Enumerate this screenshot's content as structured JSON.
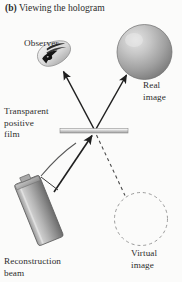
{
  "figure": {
    "caption_label": "(b)",
    "caption_text": "Viewing the hologram",
    "background_color": "#fbfbfa",
    "ink_color": "#2d2d2d"
  },
  "labels": {
    "observer": "Observer",
    "real_image_line1": "Real",
    "real_image_line2": "image",
    "film_line1": "Transparent",
    "film_line2": "positive",
    "film_line3": "film",
    "reconstruction_line1": "Reconstruction",
    "reconstruction_line2": "beam",
    "virtual_image_line1": "Virtual",
    "virtual_image_line2": "image"
  },
  "elements": {
    "sphere": {
      "name": "real-image-sphere",
      "cx": 144.5,
      "cy": 52,
      "r": 27.5,
      "fill_light": "#d9d9d9",
      "fill_dark": "#7d7d7d",
      "stroke": "#6e6e6e"
    },
    "virtual_circle": {
      "name": "virtual-image-circle",
      "cx": 141,
      "cy": 219,
      "r": 26.5,
      "stroke": "#8a8a8a",
      "dash": "3 3"
    },
    "film": {
      "name": "transparent-positive-film",
      "x": 60,
      "y": 128.5,
      "width": 68,
      "height": 4.5,
      "fill_light": "#e6e6e6",
      "fill_dark": "#a9a9a9",
      "stroke": "#8e8e8e"
    },
    "laser": {
      "name": "reconstruction-beam-laser",
      "fill_light": "#dcdcdc",
      "fill_dark": "#6f6f6f",
      "stroke": "#5d5d5d",
      "angle_deg": 21
    },
    "eye": {
      "name": "observer-eye",
      "fill_light": "#efefef",
      "fill_dark": "#9a9a9a",
      "pupil": "#1d1d1d"
    },
    "rays": {
      "to_observer": {
        "from": [
          94,
          130
        ],
        "to": [
          62,
          70
        ]
      },
      "to_real_image": {
        "from": [
          96,
          130
        ],
        "to": [
          128,
          74
        ]
      },
      "beam_to_film": {
        "from": [
          55,
          190
        ],
        "to": [
          93,
          134
        ]
      },
      "virtual_dashed": {
        "from": [
          96,
          134
        ],
        "to": [
          126,
          196
        ]
      }
    }
  }
}
